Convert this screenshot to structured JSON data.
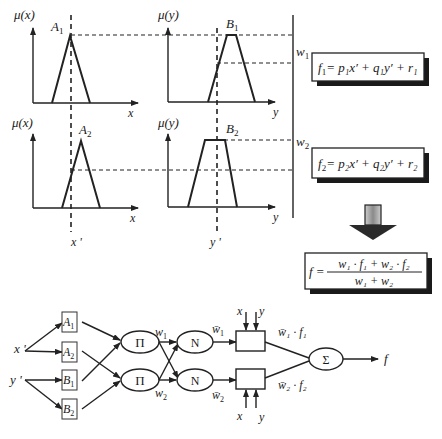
{
  "colors": {
    "ink": "#222222",
    "background": "#ffffff",
    "shadow": "#1a1a1a",
    "arrow_fill": "#9a9a9a"
  },
  "reasoning": {
    "plots": [
      {
        "id": "A1",
        "ylabel": "μ(x)",
        "xlabel": "x",
        "set_label": "A",
        "set_sub": "1",
        "shape": "triangle"
      },
      {
        "id": "B1",
        "ylabel": "μ(y)",
        "xlabel": "y",
        "set_label": "B",
        "set_sub": "1",
        "shape": "trapezoid"
      },
      {
        "id": "A2",
        "ylabel": "μ(x)",
        "xlabel": "x",
        "set_label": "A",
        "set_sub": "2",
        "shape": "triangle"
      },
      {
        "id": "B2",
        "ylabel": "μ(y)",
        "xlabel": "y",
        "set_label": "B",
        "set_sub": "2",
        "shape": "trapezoid"
      }
    ],
    "inputs": {
      "x_prime": "x '",
      "y_prime": "y '"
    },
    "weights": {
      "w1": "w",
      "w1_sub": "1",
      "w2": "w",
      "w2_sub": "2"
    }
  },
  "equations": {
    "f1": {
      "lhs": "f",
      "lhs_sub": "1",
      "text": "= p₁x′ + q₁y′ + r₁"
    },
    "f2": {
      "lhs": "f",
      "lhs_sub": "2",
      "text": "= p₂x′ + q₂y′ + r₂"
    },
    "f": {
      "lhs": "f =",
      "numerator": "w₁ · f₁  +  w₂ · f₂",
      "denominator": "w₁ + w₂"
    }
  },
  "network": {
    "inputs": [
      "x '",
      "y '"
    ],
    "layer1": [
      {
        "label": "A",
        "sub": "1"
      },
      {
        "label": "A",
        "sub": "2"
      },
      {
        "label": "B",
        "sub": "1"
      },
      {
        "label": "B",
        "sub": "2"
      }
    ],
    "layer2": [
      "Π",
      "Π"
    ],
    "layer2_outputs": [
      {
        "label": "w",
        "sub": "1"
      },
      {
        "label": "w",
        "sub": "2"
      }
    ],
    "layer3": [
      "N",
      "N"
    ],
    "layer3_outputs": [
      {
        "label": "w̄",
        "sub": "1"
      },
      {
        "label": "w̄",
        "sub": "2"
      }
    ],
    "layer4_inputs": {
      "top": [
        "x",
        "y"
      ],
      "bottom": [
        "x",
        "y"
      ]
    },
    "layer4_outputs": [
      "w̄₁ · f₁",
      "w̄₂ · f₂"
    ],
    "layer5": "Σ",
    "output": "f"
  }
}
